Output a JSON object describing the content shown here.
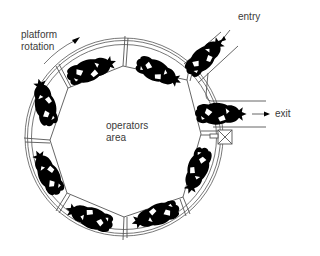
{
  "diagram": {
    "type": "rotary milking parlour (plan view)",
    "labels": {
      "platform_rotation_line1": "platform",
      "platform_rotation_line2": "rotation",
      "operators_area_line1": "operators",
      "operators_area_line2": "area",
      "entry": "entry",
      "exit": "exit"
    },
    "stall_count": 8,
    "icons": [
      "rotation-arrow-icon",
      "entry-arrow-icon",
      "exit-arrow-icon",
      "crossed-box-icon",
      "cow-icon"
    ],
    "colors": {
      "line": "#555555",
      "cow": "#000000",
      "text": "#3a3a3a",
      "background": "#ffffff"
    }
  }
}
